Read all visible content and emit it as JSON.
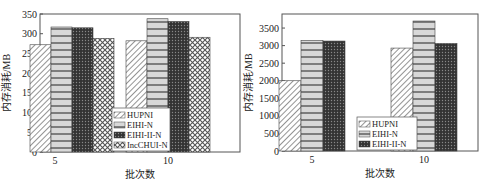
{
  "chart_data": [
    {
      "type": "bar",
      "title": "",
      "xlabel": "批次数",
      "ylabel": "内存消耗/MB",
      "categories": [
        "5",
        "10"
      ],
      "ylim": [
        0,
        350
      ],
      "yticks": [
        0,
        50,
        100,
        150,
        200,
        250,
        300,
        350
      ],
      "series": [
        {
          "name": "HUPNI",
          "values": [
            272,
            282
          ]
        },
        {
          "name": "EIHI-N",
          "values": [
            317,
            338
          ]
        },
        {
          "name": "EIHI-II-N",
          "values": [
            315,
            331
          ]
        },
        {
          "name": "IncCHUI-N",
          "values": [
            288,
            291
          ]
        }
      ],
      "legend_position": "lower center"
    },
    {
      "type": "bar",
      "title": "",
      "xlabel": "批次数",
      "ylabel": "内存消耗/MB",
      "categories": [
        "5",
        "10"
      ],
      "ylim": [
        0,
        3900
      ],
      "yticks": [
        0,
        500,
        1000,
        1500,
        2000,
        2500,
        3000,
        3500
      ],
      "series": [
        {
          "name": "HUPNI",
          "values": [
            2000,
            2930
          ]
        },
        {
          "name": "EIHI-N",
          "values": [
            3150,
            3700
          ]
        },
        {
          "name": "EIHI-II-N",
          "values": [
            3130,
            3060
          ]
        }
      ],
      "legend_position": "lower center"
    }
  ]
}
